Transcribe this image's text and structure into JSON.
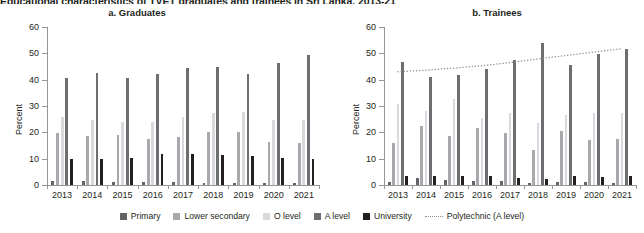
{
  "suptitle": "Educational characteristics of TVET graduates and trainees in Sri Lanka, 2013-21",
  "axis": {
    "ylabel": "Percent",
    "yticks": [
      0,
      10,
      20,
      30,
      40,
      50,
      60
    ],
    "ylim": [
      0,
      60
    ]
  },
  "legend": {
    "items": [
      {
        "label": "Primary",
        "color": "#636466",
        "type": "bar"
      },
      {
        "label": "Lower secondary",
        "color": "#a7a9ac",
        "type": "bar"
      },
      {
        "label": "O level",
        "color": "#d8d9da",
        "type": "bar"
      },
      {
        "label": "A level",
        "color": "#6d6e71",
        "type": "bar"
      },
      {
        "label": "University",
        "color": "#231f20",
        "type": "bar"
      },
      {
        "label": "Polytechnic (A level)",
        "color": "#9b8b8e",
        "type": "line"
      }
    ]
  },
  "chart_data": [
    {
      "type": "bar",
      "title": "a. Graduates",
      "xlabel": "",
      "ylabel": "Percent",
      "ylim": [
        0,
        60
      ],
      "grid": false,
      "legend_position": "bottom",
      "categories": [
        "2013",
        "2014",
        "2015",
        "2016",
        "2017",
        "2018",
        "2019",
        "2020",
        "2021"
      ],
      "series": [
        {
          "name": "Primary",
          "color": "#636466",
          "values": [
            1.6,
            1.7,
            1.3,
            1.2,
            1.0,
            0.9,
            0.8,
            0.7,
            0.6
          ]
        },
        {
          "name": "Lower secondary",
          "color": "#a7a9ac",
          "values": [
            19.7,
            18.8,
            19.0,
            17.6,
            18.2,
            20.3,
            20.0,
            16.4,
            16.0
          ]
        },
        {
          "name": "O level",
          "color": "#d8d9da",
          "values": [
            25.9,
            24.6,
            24.1,
            24.0,
            25.9,
            27.3,
            27.8,
            24.5,
            24.6
          ]
        },
        {
          "name": "A level",
          "color": "#6d6e71",
          "values": [
            40.8,
            42.7,
            40.5,
            42.1,
            44.3,
            44.8,
            42.0,
            46.5,
            49.3
          ]
        },
        {
          "name": "University",
          "color": "#231f20",
          "values": [
            9.8,
            9.8,
            10.2,
            11.6,
            11.6,
            11.5,
            11.0,
            10.2,
            10.0
          ]
        }
      ]
    },
    {
      "type": "bar",
      "title": "b. Trainees",
      "xlabel": "",
      "ylabel": "Percent",
      "ylim": [
        0,
        60
      ],
      "grid": false,
      "legend_position": "bottom",
      "categories": [
        "2013",
        "2014",
        "2015",
        "2016",
        "2017",
        "2018",
        "2019",
        "2020",
        "2021"
      ],
      "series": [
        {
          "name": "Primary",
          "color": "#636466",
          "values": [
            1.2,
            2.8,
            1.9,
            1.5,
            1.4,
            0.8,
            1.3,
            1.1,
            0.9
          ]
        },
        {
          "name": "Lower secondary",
          "color": "#a7a9ac",
          "values": [
            15.9,
            22.6,
            18.7,
            21.6,
            19.6,
            13.4,
            20.6,
            17.1,
            17.3
          ]
        },
        {
          "name": "O level",
          "color": "#d8d9da",
          "values": [
            30.9,
            28.0,
            32.6,
            25.5,
            27.4,
            23.5,
            26.6,
            27.3,
            27.5
          ]
        },
        {
          "name": "A level",
          "color": "#6d6e71",
          "values": [
            46.6,
            41.0,
            41.7,
            44.0,
            47.4,
            53.8,
            45.6,
            49.9,
            51.6
          ]
        },
        {
          "name": "University",
          "color": "#231f20",
          "values": [
            3.3,
            3.5,
            3.6,
            3.3,
            2.8,
            2.2,
            3.5,
            3.0,
            3.3
          ]
        }
      ],
      "trend": {
        "name": "Polytechnic (A level)",
        "color": "#9b8b8e",
        "style": "dotted",
        "values": [
          43.0,
          43.6,
          44.4,
          45.3,
          46.5,
          47.9,
          49.2,
          50.5,
          51.8
        ]
      }
    }
  ]
}
